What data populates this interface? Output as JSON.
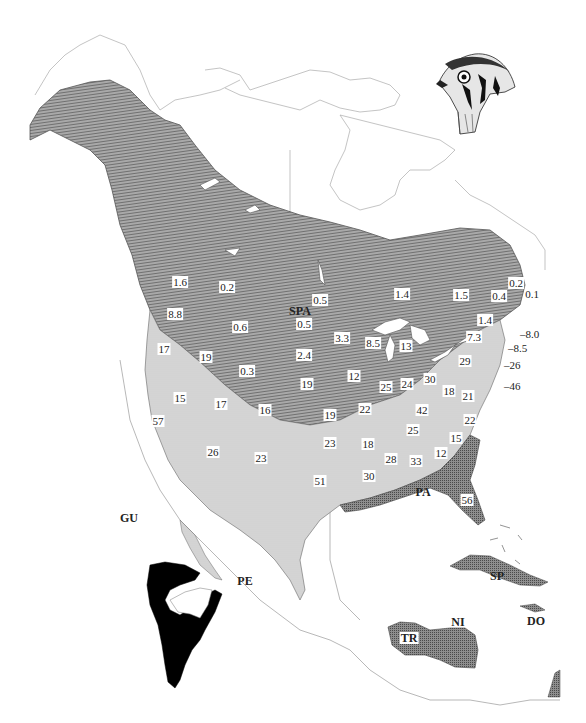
{
  "map": {
    "title": "",
    "subject_illustration": "kestrel-head",
    "legend_patterns": {
      "breeding_only": {
        "pattern": "horizontal-hatch",
        "color": "#8a8a8a"
      },
      "breeding_and_wintering": {
        "pattern": "fine-stipple",
        "color": "#c8c8c8"
      },
      "wintering_only": {
        "pattern": "dense-crosshatch",
        "color": "#6e6e6e"
      },
      "south_american_range": {
        "pattern": "solid",
        "color": "#000000"
      }
    },
    "subspecies_labels": [
      {
        "code": "SPA",
        "x": 300,
        "y": 311
      },
      {
        "code": "PA",
        "x": 423,
        "y": 492
      },
      {
        "code": "GU",
        "x": 129,
        "y": 518
      },
      {
        "code": "PE",
        "x": 245,
        "y": 581
      },
      {
        "code": "SP",
        "x": 497,
        "y": 576
      },
      {
        "code": "DO",
        "x": 536,
        "y": 621
      },
      {
        "code": "NI",
        "x": 458,
        "y": 622
      },
      {
        "code": "TR",
        "x": 409,
        "y": 638
      }
    ],
    "region_values": [
      {
        "value": "1.6",
        "x": 180,
        "y": 282,
        "box": true
      },
      {
        "value": "0.2",
        "x": 227,
        "y": 287,
        "box": true
      },
      {
        "value": "0.5",
        "x": 320,
        "y": 300,
        "box": true
      },
      {
        "value": "1.4",
        "x": 402,
        "y": 294,
        "box": true
      },
      {
        "value": "1.5",
        "x": 461,
        "y": 295,
        "box": true
      },
      {
        "value": "0.1",
        "x": 532,
        "y": 294,
        "box": false
      },
      {
        "value": "0.2",
        "x": 516,
        "y": 283,
        "box": true
      },
      {
        "value": "0.4",
        "x": 499,
        "y": 296,
        "box": true
      },
      {
        "value": "8.8",
        "x": 175,
        "y": 314,
        "box": true
      },
      {
        "value": "0.6",
        "x": 240,
        "y": 327,
        "box": true
      },
      {
        "value": "0.5",
        "x": 304,
        "y": 324,
        "box": true
      },
      {
        "value": "3.3",
        "x": 342,
        "y": 338,
        "box": true
      },
      {
        "value": "8.5",
        "x": 373,
        "y": 343,
        "box": true
      },
      {
        "value": "13",
        "x": 406,
        "y": 346,
        "box": true
      },
      {
        "value": "1.4",
        "x": 485,
        "y": 320,
        "box": true
      },
      {
        "value": "7.3",
        "x": 474,
        "y": 337,
        "box": true
      },
      {
        "value": "17",
        "x": 164,
        "y": 349,
        "box": true
      },
      {
        "value": "19",
        "x": 206,
        "y": 357,
        "box": true
      },
      {
        "value": "2.4",
        "x": 304,
        "y": 355,
        "box": true
      },
      {
        "value": "0.3",
        "x": 247,
        "y": 371,
        "box": true
      },
      {
        "value": "12",
        "x": 354,
        "y": 376,
        "box": true
      },
      {
        "value": "25",
        "x": 386,
        "y": 387,
        "box": true
      },
      {
        "value": "24",
        "x": 407,
        "y": 384,
        "box": true
      },
      {
        "value": "30",
        "x": 430,
        "y": 379,
        "box": true
      },
      {
        "value": "29",
        "x": 465,
        "y": 361,
        "box": true
      },
      {
        "value": "18",
        "x": 449,
        "y": 391,
        "box": true
      },
      {
        "value": "21",
        "x": 468,
        "y": 396,
        "box": true
      },
      {
        "value": "19",
        "x": 307,
        "y": 384,
        "box": true
      },
      {
        "value": "15",
        "x": 180,
        "y": 398,
        "box": true
      },
      {
        "value": "17",
        "x": 221,
        "y": 404,
        "box": true
      },
      {
        "value": "16",
        "x": 265,
        "y": 410,
        "box": true
      },
      {
        "value": "19",
        "x": 330,
        "y": 415,
        "box": true
      },
      {
        "value": "22",
        "x": 365,
        "y": 409,
        "box": true
      },
      {
        "value": "42",
        "x": 422,
        "y": 410,
        "box": true
      },
      {
        "value": "22",
        "x": 470,
        "y": 420,
        "box": true
      },
      {
        "value": "57",
        "x": 158,
        "y": 421,
        "box": true
      },
      {
        "value": "23",
        "x": 330,
        "y": 443,
        "box": true
      },
      {
        "value": "18",
        "x": 368,
        "y": 444,
        "box": true
      },
      {
        "value": "25",
        "x": 413,
        "y": 430,
        "box": true
      },
      {
        "value": "15",
        "x": 456,
        "y": 438,
        "box": true
      },
      {
        "value": "26",
        "x": 213,
        "y": 452,
        "box": true
      },
      {
        "value": "23",
        "x": 261,
        "y": 458,
        "box": true
      },
      {
        "value": "28",
        "x": 391,
        "y": 459,
        "box": true
      },
      {
        "value": "33",
        "x": 416,
        "y": 461,
        "box": true
      },
      {
        "value": "12",
        "x": 441,
        "y": 453,
        "box": true
      },
      {
        "value": "30",
        "x": 369,
        "y": 476,
        "box": true
      },
      {
        "value": "51",
        "x": 320,
        "y": 481,
        "box": true
      },
      {
        "value": "56",
        "x": 467,
        "y": 500,
        "box": true
      }
    ],
    "coastal_callouts": [
      {
        "value": "8.0",
        "x": 520,
        "y": 334
      },
      {
        "value": "8.5",
        "x": 508,
        "y": 348
      },
      {
        "value": "26",
        "x": 504,
        "y": 365
      },
      {
        "value": "46",
        "x": 504,
        "y": 386
      }
    ]
  }
}
